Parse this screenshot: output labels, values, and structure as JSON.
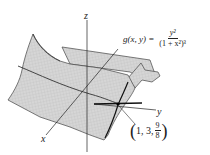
{
  "figure": {
    "type": "3d-surface-plot",
    "function": {
      "lhs": "g(x, y) =",
      "numerator": "y²",
      "denominator": "(1 + x²)³"
    },
    "axes": {
      "x_label": "x",
      "y_label": "y",
      "z_label": "z"
    },
    "highlighted_point": {
      "x": "1",
      "y": "3",
      "z_numerator": "9",
      "z_denominator": "8",
      "prefix": "1, 3,"
    },
    "colors": {
      "surface_fill": "#d4d4d4",
      "mesh": "#b8b8b8",
      "outline": "#333333",
      "axis": "#222222"
    }
  }
}
